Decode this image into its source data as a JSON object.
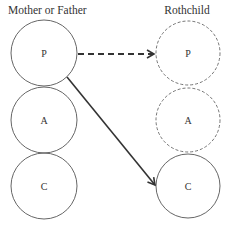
{
  "diagram": {
    "left_title": "Mother or Father",
    "right_title": "Rothchild",
    "left_nodes": [
      {
        "label": "P"
      },
      {
        "label": "A"
      },
      {
        "label": "C"
      }
    ],
    "right_nodes": [
      {
        "label": "P",
        "style": "dashed"
      },
      {
        "label": "A",
        "style": "dashed"
      },
      {
        "label": "C",
        "style": "solid"
      }
    ],
    "edges": [
      {
        "from": "left.P",
        "to": "right.P",
        "style": "dashed"
      },
      {
        "from": "left.P",
        "to": "right.C",
        "style": "solid"
      }
    ]
  }
}
